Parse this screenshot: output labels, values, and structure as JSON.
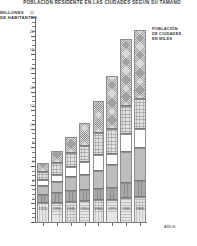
{
  "title": "POBLACIÓN RESIDENTE EN LAS CIUDADES SEGÚN SU TAMAÑO",
  "y_caption": "MILLONES\nDE HABITANTES",
  "y_caption_line1": "MILLONES",
  "y_caption_line2": "DE HABITANTES",
  "x_caption": "AÑOS",
  "legend": {
    "title_line1": "POBLACIÓN",
    "title_line2": "DE CIUDADES",
    "title_line3": "EN MILES",
    "items": [
      {
        "label": "> 250.000",
        "key": "gt250"
      },
      {
        "label": "100-250",
        "key": "100-250"
      },
      {
        "label": "50-100",
        "key": "50-100"
      },
      {
        "label": "20-50",
        "key": "20-50"
      },
      {
        "label": "10-20",
        "key": "10-20"
      },
      {
        "label": "5-10",
        "key": "5-10"
      }
    ]
  },
  "chart_data": {
    "type": "bar",
    "stacked": true,
    "title": "POBLACIÓN RESIDENTE EN LAS CIUDADES SEGÚN SU TAMAÑO",
    "xlabel": "AÑOS",
    "ylabel": "MILLONES DE HABITANTES",
    "grid": false,
    "legend_position": "right",
    "categories": [
      "1920",
      "1930",
      "1940",
      "1950",
      "1960",
      "1970",
      "1981",
      "1991"
    ],
    "ylim": [
      0,
      22
    ],
    "yticks": [
      0,
      2,
      4,
      6,
      8,
      10,
      12,
      14,
      16,
      18,
      20,
      22
    ],
    "ytick_labels": [
      "0",
      "2",
      "4",
      "6",
      "8",
      "10",
      "12",
      "14",
      "16",
      "18",
      "20",
      "22"
    ],
    "series": [
      {
        "name": "5-10",
        "values": [
          2.1,
          2.2,
          2.3,
          2.4,
          2.5,
          2.5,
          2.7,
          2.8
        ]
      },
      {
        "name": "10-20",
        "values": [
          0.9,
          1.0,
          1.1,
          1.1,
          1.2,
          1.3,
          1.6,
          1.7
        ]
      },
      {
        "name": "20-50",
        "values": [
          1.0,
          1.2,
          1.5,
          1.6,
          1.9,
          2.4,
          3.3,
          3.6
        ]
      },
      {
        "name": "50-100",
        "values": [
          0.6,
          0.8,
          1.1,
          1.5,
          1.7,
          1.2,
          1.9,
          2.0
        ]
      },
      {
        "name": "100-250",
        "values": [
          0.9,
          1.2,
          1.5,
          1.7,
          2.4,
          2.7,
          3.1,
          3.2
        ]
      },
      {
        "name": "> 250.000",
        "values": [
          0.9,
          1.3,
          1.7,
          2.4,
          3.4,
          5.7,
          7.2,
          7.4
        ]
      }
    ],
    "totals": [
      6.4,
      7.7,
      9.2,
      10.7,
      13.1,
      15.8,
      19.8,
      20.7
    ]
  }
}
